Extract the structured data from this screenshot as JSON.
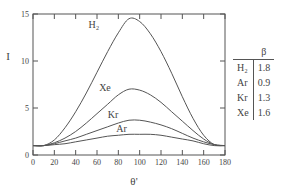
{
  "chart_data": {
    "type": "line",
    "title": "",
    "xlabel": "θ'",
    "ylabel": "I",
    "xlim": [
      0,
      180
    ],
    "ylim": [
      0,
      15
    ],
    "xticks": [
      0,
      20,
      40,
      60,
      80,
      100,
      120,
      140,
      160,
      180
    ],
    "yticks": [
      0,
      5,
      10,
      15
    ],
    "grid": false,
    "x": [
      0,
      10,
      20,
      30,
      40,
      50,
      60,
      70,
      80,
      90,
      100,
      110,
      120,
      130,
      140,
      150,
      160,
      170,
      180
    ],
    "series": [
      {
        "name": "H2",
        "label": "H₂",
        "values": [
          1.0,
          1.0,
          1.6,
          2.9,
          4.6,
          6.6,
          8.8,
          11.0,
          13.0,
          14.5,
          14.2,
          12.9,
          11.0,
          8.7,
          6.2,
          3.9,
          2.1,
          1.1,
          1.0
        ]
      },
      {
        "name": "Xe",
        "label": "Xe",
        "values": [
          1.0,
          1.0,
          1.3,
          1.8,
          2.5,
          3.4,
          4.4,
          5.4,
          6.4,
          7.0,
          6.9,
          6.4,
          5.6,
          4.6,
          3.6,
          2.6,
          1.7,
          1.1,
          1.0
        ]
      },
      {
        "name": "Kr",
        "label": "Kr",
        "values": [
          1.0,
          1.0,
          1.2,
          1.5,
          1.8,
          2.2,
          2.6,
          3.0,
          3.4,
          3.7,
          3.7,
          3.5,
          3.2,
          2.8,
          2.3,
          1.8,
          1.4,
          1.1,
          1.0
        ]
      },
      {
        "name": "Ar",
        "label": "Ar",
        "values": [
          1.0,
          1.0,
          1.1,
          1.2,
          1.4,
          1.6,
          1.8,
          2.0,
          2.1,
          2.2,
          2.2,
          2.2,
          2.1,
          1.9,
          1.7,
          1.5,
          1.2,
          1.0,
          1.0
        ]
      }
    ],
    "annotations": [
      {
        "text": "H₂",
        "x": 52,
        "y": 13.5
      },
      {
        "text": "Xe",
        "x": 62,
        "y": 6.8
      },
      {
        "text": "Kr",
        "x": 70,
        "y": 3.9
      },
      {
        "text": "Ar",
        "x": 78,
        "y": 2.5
      }
    ],
    "legend_table": {
      "header": "β",
      "rows": [
        {
          "gas": "H₂",
          "beta": "1.8"
        },
        {
          "gas": "Ar",
          "beta": "0.9"
        },
        {
          "gas": "Kr",
          "beta": "1.3"
        },
        {
          "gas": "Xe",
          "beta": "1.6"
        }
      ]
    }
  },
  "colors": {
    "axis": "#555555",
    "line": "#555555",
    "text": "#444444"
  }
}
